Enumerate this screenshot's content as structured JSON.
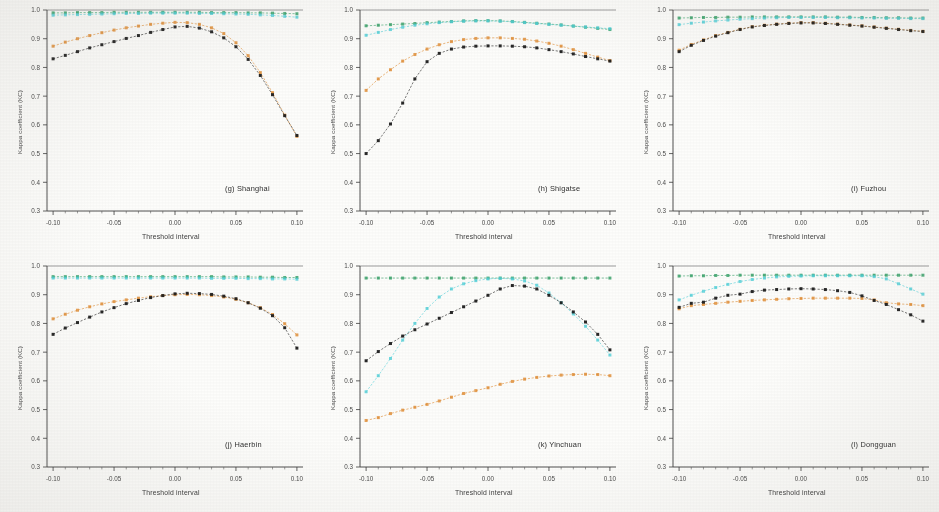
{
  "figure": {
    "axis_labels": {
      "x": "Threshold interval",
      "y": "Kappa coefficient (KC)"
    },
    "series_colors": {
      "green": "#2f9e63",
      "cyan": "#4fd0d8",
      "black": "#1d1d1d",
      "orange": "#e08a2e"
    }
  },
  "chart_data": [
    {
      "type": "line",
      "title": "(g) Shanghai",
      "xlabel": "Threshold interval",
      "ylabel": "Kappa coefficient (KC)",
      "xlim": [
        -0.105,
        0.105
      ],
      "ylim": [
        0.3,
        1.0
      ],
      "xticks": [
        -0.1,
        -0.05,
        0.0,
        0.05,
        0.1
      ],
      "xticklabels": [
        "-0.10",
        "-0.05",
        "0.00",
        "0.05",
        "0.10"
      ],
      "yticks": [
        0.3,
        0.4,
        0.5,
        0.6,
        0.7,
        0.8,
        0.9,
        1.0
      ],
      "yticklabels": [
        "0.3",
        "0.4",
        "0.5",
        "0.6",
        "0.7",
        "0.8",
        "0.9",
        "1.0"
      ],
      "grid": false,
      "legend": "none",
      "x": [
        -0.1,
        -0.09,
        -0.08,
        -0.07,
        -0.06,
        -0.05,
        -0.04,
        -0.03,
        -0.02,
        -0.01,
        0.0,
        0.01,
        0.02,
        0.03,
        0.04,
        0.05,
        0.06,
        0.07,
        0.08,
        0.09,
        0.1
      ],
      "series": [
        {
          "name": "green",
          "values": [
            0.99,
            0.99,
            0.991,
            0.991,
            0.991,
            0.992,
            0.992,
            0.992,
            0.992,
            0.992,
            0.992,
            0.992,
            0.992,
            0.991,
            0.991,
            0.991,
            0.99,
            0.99,
            0.989,
            0.988,
            0.987
          ]
        },
        {
          "name": "cyan",
          "values": [
            0.982,
            0.983,
            0.984,
            0.985,
            0.986,
            0.987,
            0.988,
            0.988,
            0.989,
            0.989,
            0.989,
            0.989,
            0.988,
            0.988,
            0.987,
            0.986,
            0.985,
            0.983,
            0.981,
            0.978,
            0.975
          ]
        },
        {
          "name": "orange",
          "values": [
            0.874,
            0.888,
            0.9,
            0.911,
            0.921,
            0.93,
            0.938,
            0.944,
            0.95,
            0.954,
            0.957,
            0.956,
            0.95,
            0.938,
            0.918,
            0.886,
            0.841,
            0.782,
            0.712,
            0.634,
            0.56
          ]
        },
        {
          "name": "black",
          "values": [
            0.83,
            0.842,
            0.855,
            0.868,
            0.879,
            0.89,
            0.901,
            0.911,
            0.922,
            0.932,
            0.941,
            0.943,
            0.937,
            0.924,
            0.903,
            0.872,
            0.828,
            0.772,
            0.705,
            0.632,
            0.563
          ]
        }
      ]
    },
    {
      "type": "line",
      "title": "(h) Shigatse",
      "xlabel": "Threshold interval",
      "ylabel": "Kappa coefficient (KC)",
      "xlim": [
        -0.105,
        0.105
      ],
      "ylim": [
        0.3,
        1.0
      ],
      "xticks": [
        -0.1,
        -0.05,
        0.0,
        0.05,
        0.1
      ],
      "xticklabels": [
        "-0.10",
        "-0.05",
        "0.00",
        "0.05",
        "0.10"
      ],
      "yticks": [
        0.3,
        0.4,
        0.5,
        0.6,
        0.7,
        0.8,
        0.9,
        1.0
      ],
      "yticklabels": [
        "0.3",
        "0.4",
        "0.5",
        "0.6",
        "0.7",
        "0.8",
        "0.9",
        "1.0"
      ],
      "grid": false,
      "legend": "none",
      "x": [
        -0.1,
        -0.09,
        -0.08,
        -0.07,
        -0.06,
        -0.05,
        -0.04,
        -0.03,
        -0.02,
        -0.01,
        0.0,
        0.01,
        0.02,
        0.03,
        0.04,
        0.05,
        0.06,
        0.07,
        0.08,
        0.09,
        0.1
      ],
      "series": [
        {
          "name": "green",
          "values": [
            0.945,
            0.947,
            0.949,
            0.951,
            0.953,
            0.956,
            0.958,
            0.96,
            0.962,
            0.963,
            0.963,
            0.962,
            0.96,
            0.957,
            0.954,
            0.951,
            0.948,
            0.944,
            0.94,
            0.936,
            0.932
          ]
        },
        {
          "name": "cyan",
          "values": [
            0.912,
            0.922,
            0.932,
            0.94,
            0.947,
            0.952,
            0.956,
            0.959,
            0.961,
            0.962,
            0.962,
            0.961,
            0.959,
            0.956,
            0.953,
            0.95,
            0.947,
            0.944,
            0.941,
            0.938,
            0.935
          ]
        },
        {
          "name": "orange",
          "values": [
            0.72,
            0.76,
            0.792,
            0.822,
            0.845,
            0.864,
            0.879,
            0.89,
            0.897,
            0.901,
            0.903,
            0.903,
            0.901,
            0.898,
            0.892,
            0.884,
            0.874,
            0.862,
            0.849,
            0.836,
            0.824
          ]
        },
        {
          "name": "black",
          "values": [
            0.5,
            0.545,
            0.603,
            0.676,
            0.76,
            0.82,
            0.849,
            0.864,
            0.871,
            0.874,
            0.875,
            0.875,
            0.874,
            0.872,
            0.868,
            0.862,
            0.855,
            0.847,
            0.838,
            0.83,
            0.822
          ]
        }
      ]
    },
    {
      "type": "line",
      "title": "(i) Fuzhou",
      "xlabel": "Threshold interval",
      "ylabel": "Kappa coefficient (KC)",
      "xlim": [
        -0.105,
        0.105
      ],
      "ylim": [
        0.3,
        1.0
      ],
      "xticks": [
        -0.1,
        -0.05,
        0.0,
        0.05,
        0.1
      ],
      "xticklabels": [
        "-0.10",
        "-0.05",
        "0.00",
        "0.05",
        "0.10"
      ],
      "yticks": [
        0.3,
        0.4,
        0.5,
        0.6,
        0.7,
        0.8,
        0.9,
        1.0
      ],
      "yticklabels": [
        "0.3",
        "0.4",
        "0.5",
        "0.6",
        "0.7",
        "0.8",
        "0.9",
        "1.0"
      ],
      "grid": false,
      "legend": "none",
      "x": [
        -0.1,
        -0.09,
        -0.08,
        -0.07,
        -0.06,
        -0.05,
        -0.04,
        -0.03,
        -0.02,
        -0.01,
        0.0,
        0.01,
        0.02,
        0.03,
        0.04,
        0.05,
        0.06,
        0.07,
        0.08,
        0.09,
        0.1
      ],
      "series": [
        {
          "name": "green",
          "values": [
            0.972,
            0.973,
            0.974,
            0.974,
            0.975,
            0.975,
            0.976,
            0.976,
            0.976,
            0.976,
            0.976,
            0.976,
            0.976,
            0.975,
            0.975,
            0.974,
            0.974,
            0.973,
            0.973,
            0.972,
            0.972
          ]
        },
        {
          "name": "cyan",
          "values": [
            0.949,
            0.954,
            0.958,
            0.962,
            0.965,
            0.968,
            0.97,
            0.972,
            0.973,
            0.974,
            0.974,
            0.974,
            0.974,
            0.973,
            0.973,
            0.972,
            0.972,
            0.971,
            0.971,
            0.97,
            0.97
          ]
        },
        {
          "name": "orange",
          "values": [
            0.86,
            0.88,
            0.896,
            0.911,
            0.922,
            0.933,
            0.942,
            0.947,
            0.951,
            0.954,
            0.956,
            0.956,
            0.954,
            0.951,
            0.948,
            0.945,
            0.941,
            0.937,
            0.933,
            0.929,
            0.926
          ]
        },
        {
          "name": "black",
          "values": [
            0.855,
            0.877,
            0.894,
            0.909,
            0.921,
            0.932,
            0.941,
            0.946,
            0.95,
            0.953,
            0.955,
            0.955,
            0.953,
            0.95,
            0.947,
            0.944,
            0.94,
            0.936,
            0.932,
            0.928,
            0.925
          ]
        }
      ]
    },
    {
      "type": "line",
      "title": "(j) Haerbin",
      "xlabel": "Threshold interval",
      "ylabel": "Kappa coefficient (KC)",
      "xlim": [
        -0.105,
        0.105
      ],
      "ylim": [
        0.3,
        1.0
      ],
      "xticks": [
        -0.1,
        -0.05,
        0.0,
        0.05,
        0.1
      ],
      "xticklabels": [
        "-0.10",
        "-0.05",
        "0.00",
        "0.05",
        "0.10"
      ],
      "yticks": [
        0.3,
        0.4,
        0.5,
        0.6,
        0.7,
        0.8,
        0.9,
        1.0
      ],
      "yticklabels": [
        "0.3",
        "0.4",
        "0.5",
        "0.6",
        "0.7",
        "0.8",
        "0.9",
        "1.0"
      ],
      "grid": false,
      "legend": "none",
      "x": [
        -0.1,
        -0.09,
        -0.08,
        -0.07,
        -0.06,
        -0.05,
        -0.04,
        -0.03,
        -0.02,
        -0.01,
        0.0,
        0.01,
        0.02,
        0.03,
        0.04,
        0.05,
        0.06,
        0.07,
        0.08,
        0.09,
        0.1
      ],
      "series": [
        {
          "name": "green",
          "values": [
            0.963,
            0.963,
            0.963,
            0.963,
            0.963,
            0.963,
            0.963,
            0.963,
            0.963,
            0.963,
            0.963,
            0.963,
            0.963,
            0.963,
            0.962,
            0.962,
            0.962,
            0.961,
            0.961,
            0.96,
            0.96
          ]
        },
        {
          "name": "cyan",
          "values": [
            0.958,
            0.958,
            0.958,
            0.958,
            0.958,
            0.958,
            0.958,
            0.958,
            0.958,
            0.958,
            0.958,
            0.958,
            0.958,
            0.957,
            0.957,
            0.957,
            0.956,
            0.956,
            0.955,
            0.955,
            0.954
          ]
        },
        {
          "name": "orange",
          "values": [
            0.816,
            0.832,
            0.846,
            0.858,
            0.868,
            0.876,
            0.882,
            0.888,
            0.893,
            0.897,
            0.9,
            0.901,
            0.9,
            0.897,
            0.892,
            0.884,
            0.872,
            0.855,
            0.831,
            0.799,
            0.76
          ]
        },
        {
          "name": "black",
          "values": [
            0.762,
            0.784,
            0.803,
            0.822,
            0.84,
            0.855,
            0.869,
            0.88,
            0.89,
            0.897,
            0.903,
            0.905,
            0.904,
            0.901,
            0.895,
            0.886,
            0.872,
            0.853,
            0.827,
            0.785,
            0.714
          ]
        }
      ]
    },
    {
      "type": "line",
      "title": "(k) Yinchuan",
      "xlabel": "Threshold interval",
      "ylabel": "Kappa coefficient (KC)",
      "xlim": [
        -0.105,
        0.105
      ],
      "ylim": [
        0.3,
        1.0
      ],
      "xticks": [
        -0.1,
        -0.05,
        0.0,
        0.05,
        0.1
      ],
      "xticklabels": [
        "-0.10",
        "-0.05",
        "0.00",
        "0.05",
        "0.10"
      ],
      "yticks": [
        0.3,
        0.4,
        0.5,
        0.6,
        0.7,
        0.8,
        0.9,
        1.0
      ],
      "yticklabels": [
        "0.3",
        "0.4",
        "0.5",
        "0.6",
        "0.7",
        "0.8",
        "0.9",
        "1.0"
      ],
      "grid": false,
      "legend": "none",
      "x": [
        -0.1,
        -0.09,
        -0.08,
        -0.07,
        -0.06,
        -0.05,
        -0.04,
        -0.03,
        -0.02,
        -0.01,
        0.0,
        0.01,
        0.02,
        0.03,
        0.04,
        0.05,
        0.06,
        0.07,
        0.08,
        0.09,
        0.1
      ],
      "series": [
        {
          "name": "green",
          "values": [
            0.958,
            0.958,
            0.958,
            0.958,
            0.958,
            0.958,
            0.958,
            0.958,
            0.958,
            0.958,
            0.958,
            0.958,
            0.958,
            0.958,
            0.958,
            0.958,
            0.958,
            0.958,
            0.958,
            0.958,
            0.958
          ]
        },
        {
          "name": "cyan",
          "values": [
            0.562,
            0.618,
            0.678,
            0.742,
            0.8,
            0.852,
            0.892,
            0.92,
            0.938,
            0.949,
            0.955,
            0.957,
            0.955,
            0.948,
            0.933,
            0.906,
            0.872,
            0.833,
            0.79,
            0.742,
            0.69
          ]
        },
        {
          "name": "orange",
          "values": [
            0.462,
            0.472,
            0.486,
            0.498,
            0.508,
            0.518,
            0.53,
            0.543,
            0.556,
            0.566,
            0.576,
            0.588,
            0.598,
            0.606,
            0.612,
            0.617,
            0.62,
            0.622,
            0.623,
            0.622,
            0.618
          ]
        },
        {
          "name": "black",
          "values": [
            0.67,
            0.702,
            0.73,
            0.756,
            0.778,
            0.798,
            0.818,
            0.838,
            0.858,
            0.878,
            0.898,
            0.92,
            0.932,
            0.93,
            0.92,
            0.898,
            0.872,
            0.84,
            0.805,
            0.762,
            0.708
          ]
        }
      ]
    },
    {
      "type": "line",
      "title": "(l) Dongguan",
      "xlabel": "Threshold interval",
      "ylabel": "Kappa coefficient (KC)",
      "xlim": [
        -0.105,
        0.105
      ],
      "ylim": [
        0.3,
        1.0
      ],
      "xticks": [
        -0.1,
        -0.05,
        0.0,
        0.05,
        0.1
      ],
      "xticklabels": [
        "-0.10",
        "-0.05",
        "0.00",
        "0.05",
        "0.10"
      ],
      "yticks": [
        0.3,
        0.4,
        0.5,
        0.6,
        0.7,
        0.8,
        0.9,
        1.0
      ],
      "yticklabels": [
        "0.3",
        "0.4",
        "0.5",
        "0.6",
        "0.7",
        "0.8",
        "0.9",
        "1.0"
      ],
      "grid": false,
      "legend": "none",
      "x": [
        -0.1,
        -0.09,
        -0.08,
        -0.07,
        -0.06,
        -0.05,
        -0.04,
        -0.03,
        -0.02,
        -0.01,
        0.0,
        0.01,
        0.02,
        0.03,
        0.04,
        0.05,
        0.06,
        0.07,
        0.08,
        0.09,
        0.1
      ],
      "series": [
        {
          "name": "green",
          "values": [
            0.965,
            0.966,
            0.966,
            0.967,
            0.967,
            0.968,
            0.968,
            0.968,
            0.968,
            0.968,
            0.968,
            0.968,
            0.968,
            0.968,
            0.968,
            0.968,
            0.968,
            0.968,
            0.968,
            0.968,
            0.968
          ]
        },
        {
          "name": "cyan",
          "values": [
            0.882,
            0.898,
            0.912,
            0.925,
            0.936,
            0.946,
            0.953,
            0.958,
            0.962,
            0.964,
            0.965,
            0.966,
            0.966,
            0.966,
            0.966,
            0.966,
            0.963,
            0.955,
            0.938,
            0.92,
            0.902
          ]
        },
        {
          "name": "orange",
          "values": [
            0.851,
            0.862,
            0.866,
            0.87,
            0.874,
            0.877,
            0.88,
            0.882,
            0.884,
            0.886,
            0.887,
            0.888,
            0.888,
            0.888,
            0.888,
            0.887,
            0.882,
            0.872,
            0.868,
            0.866,
            0.862
          ]
        },
        {
          "name": "black",
          "values": [
            0.856,
            0.87,
            0.874,
            0.888,
            0.898,
            0.902,
            0.911,
            0.916,
            0.918,
            0.92,
            0.921,
            0.92,
            0.918,
            0.914,
            0.908,
            0.896,
            0.88,
            0.866,
            0.848,
            0.83,
            0.808
          ]
        }
      ]
    }
  ]
}
